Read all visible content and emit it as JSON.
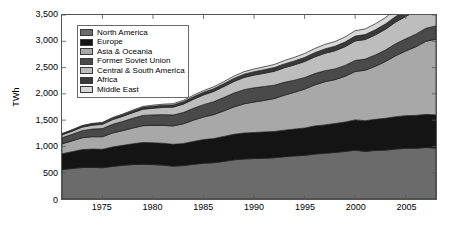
{
  "chart_data": {
    "type": "area",
    "stacked": true,
    "title": "",
    "subtitle": "",
    "xlabel": "",
    "ylabel": "TWh",
    "xlim": [
      1971,
      2008
    ],
    "ylim": [
      0,
      3500
    ],
    "ytick_labels": [
      "0",
      "500",
      "1,000",
      "1,500",
      "2,000",
      "2,500",
      "3,000",
      "3,500"
    ],
    "ytick_values": [
      0,
      500,
      1000,
      1500,
      2000,
      2500,
      3000,
      3500
    ],
    "xtick_labels": [
      "1975",
      "1980",
      "1985",
      "1990",
      "1995",
      "2000",
      "2005"
    ],
    "xtick_values": [
      1975,
      1980,
      1985,
      1990,
      1995,
      2000,
      2005
    ],
    "grid": false,
    "legend_position": "upper-left",
    "x": [
      1971,
      1972,
      1973,
      1974,
      1975,
      1976,
      1977,
      1978,
      1979,
      1980,
      1981,
      1982,
      1983,
      1984,
      1985,
      1986,
      1987,
      1988,
      1989,
      1990,
      1991,
      1992,
      1993,
      1994,
      1995,
      1996,
      1997,
      1998,
      1999,
      2000,
      2001,
      2002,
      2003,
      2004,
      2005,
      2006,
      2007,
      2008
    ],
    "series": [
      {
        "name": "North America",
        "color": "#6b6b6b",
        "values": [
          560,
          580,
          600,
          600,
          595,
          620,
          640,
          655,
          660,
          655,
          645,
          625,
          635,
          660,
          680,
          690,
          715,
          745,
          760,
          770,
          775,
          785,
          805,
          820,
          830,
          855,
          870,
          885,
          905,
          930,
          905,
          925,
          930,
          950,
          965,
          965,
          980,
          970
        ]
      },
      {
        "name": "Europe",
        "color": "#141414",
        "values": [
          300,
          320,
          340,
          350,
          350,
          370,
          380,
          395,
          415,
          415,
          415,
          415,
          420,
          435,
          450,
          460,
          475,
          485,
          495,
          495,
          500,
          500,
          505,
          510,
          520,
          535,
          540,
          550,
          560,
          575,
          585,
          590,
          605,
          615,
          620,
          625,
          630,
          630
        ]
      },
      {
        "name": "Asia & Oceania",
        "color": "#a8a8a8",
        "values": [
          190,
          205,
          225,
          235,
          240,
          265,
          280,
          300,
          320,
          330,
          340,
          350,
          375,
          405,
          430,
          455,
          485,
          520,
          555,
          580,
          600,
          625,
          665,
          700,
          740,
          780,
          820,
          835,
          870,
          920,
          960,
          1010,
          1080,
          1160,
          1230,
          1305,
          1390,
          1440
        ]
      },
      {
        "name": "Former Soviet Union",
        "color": "#4a4a4a",
        "values": [
          115,
          125,
          135,
          145,
          155,
          165,
          175,
          185,
          195,
          200,
          205,
          210,
          215,
          225,
          235,
          245,
          255,
          265,
          270,
          270,
          265,
          255,
          245,
          230,
          220,
          215,
          210,
          205,
          205,
          210,
          212,
          215,
          220,
          228,
          232,
          240,
          248,
          252
        ]
      },
      {
        "name": "Central & South America",
        "color": "#bdbdbd",
        "values": [
          55,
          60,
          68,
          75,
          82,
          90,
          98,
          108,
          118,
          128,
          138,
          148,
          160,
          172,
          185,
          195,
          208,
          220,
          232,
          242,
          252,
          265,
          278,
          292,
          305,
          318,
          332,
          345,
          358,
          372,
          372,
          382,
          395,
          412,
          425,
          440,
          455,
          465
        ]
      },
      {
        "name": "Africa",
        "color": "#3a3a3a",
        "values": [
          18,
          20,
          22,
          24,
          26,
          28,
          30,
          33,
          36,
          38,
          40,
          42,
          45,
          48,
          50,
          53,
          56,
          59,
          62,
          65,
          67,
          70,
          72,
          75,
          78,
          80,
          83,
          85,
          88,
          92,
          94,
          97,
          100,
          105,
          108,
          112,
          116,
          118
        ]
      },
      {
        "name": "Middle East",
        "color": "#d8d8d8",
        "values": [
          6,
          7,
          8,
          9,
          10,
          11,
          13,
          15,
          17,
          19,
          21,
          23,
          26,
          29,
          32,
          35,
          39,
          43,
          47,
          51,
          55,
          59,
          64,
          69,
          74,
          79,
          85,
          90,
          96,
          102,
          108,
          114,
          121,
          128,
          135,
          142,
          150,
          155
        ]
      }
    ]
  },
  "legend": {
    "items": [
      {
        "label": "North America"
      },
      {
        "label": "Europe"
      },
      {
        "label": "Asia & Oceania"
      },
      {
        "label": "Former Soviet Union"
      },
      {
        "label": "Central & South America"
      },
      {
        "label": "Africa"
      },
      {
        "label": "Middle East"
      }
    ]
  }
}
